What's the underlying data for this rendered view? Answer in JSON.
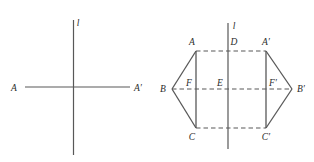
{
  "figure": {
    "caption": "Two geometry diagrams: a line of reflection with a point and its image, and a hexagonal figure reflected across a vertical line",
    "stroke_color": "#585858",
    "label_color": "#2b2b2b",
    "background": "#ffffff",
    "left_diagram": {
      "name": "point-reflection-diagram",
      "axis_label": "l",
      "axis": {
        "x": 73.5,
        "y1": 20,
        "y2": 155
      },
      "segment": {
        "x1": 25,
        "y1": 87,
        "x2": 130,
        "y2": 87
      },
      "labels": [
        {
          "text": "A",
          "x": 14,
          "y": 90.5
        },
        {
          "text": "A′",
          "x": 133,
          "y": 90.5
        },
        {
          "text": "l",
          "x": 78,
          "y": 26
        }
      ]
    },
    "right_diagram": {
      "name": "hexagon-reflection-diagram",
      "axis_label": "l",
      "axis": {
        "x": 228,
        "y1": 23,
        "y2": 149
      },
      "solid_segments": [
        {
          "name": "segment-AC",
          "x1": 196,
          "y1": 51,
          "x2": 196,
          "y2": 128
        },
        {
          "name": "segment-AB",
          "x1": 196,
          "y1": 51,
          "x2": 172,
          "y2": 89
        },
        {
          "name": "segment-BC",
          "x1": 172,
          "y1": 89,
          "x2": 196,
          "y2": 128
        },
        {
          "name": "segment-A-prime-C-prime",
          "x1": 266,
          "y1": 51,
          "x2": 266,
          "y2": 128
        },
        {
          "name": "segment-A-prime-B-prime",
          "x1": 266,
          "y1": 51,
          "x2": 292,
          "y2": 89
        },
        {
          "name": "segment-B-prime-C-prime",
          "x1": 292,
          "y1": 89,
          "x2": 266,
          "y2": 128
        }
      ],
      "dashed_segments": [
        {
          "name": "dashed-A-to-A-prime",
          "x1": 196,
          "y1": 51,
          "x2": 266,
          "y2": 51
        },
        {
          "name": "dashed-B-to-B-prime",
          "x1": 172,
          "y1": 89,
          "x2": 292,
          "y2": 89
        },
        {
          "name": "dashed-C-to-C-prime",
          "x1": 196,
          "y1": 128,
          "x2": 266,
          "y2": 128
        }
      ],
      "labels": [
        {
          "text": "l",
          "x": 233,
          "y": 29
        },
        {
          "text": "A",
          "x": 190,
          "y": 44
        },
        {
          "text": "D",
          "x": 232,
          "y": 44
        },
        {
          "text": "A′",
          "x": 262,
          "y": 44
        },
        {
          "text": "B",
          "x": 163,
          "y": 92
        },
        {
          "text": "F",
          "x": 185,
          "y": 85
        },
        {
          "text": "E",
          "x": 216,
          "y": 85
        },
        {
          "text": "F′",
          "x": 269,
          "y": 85
        },
        {
          "text": "B′",
          "x": 296,
          "y": 92
        },
        {
          "text": "C",
          "x": 190,
          "y": 140
        },
        {
          "text": "C′",
          "x": 262,
          "y": 140
        }
      ]
    }
  }
}
